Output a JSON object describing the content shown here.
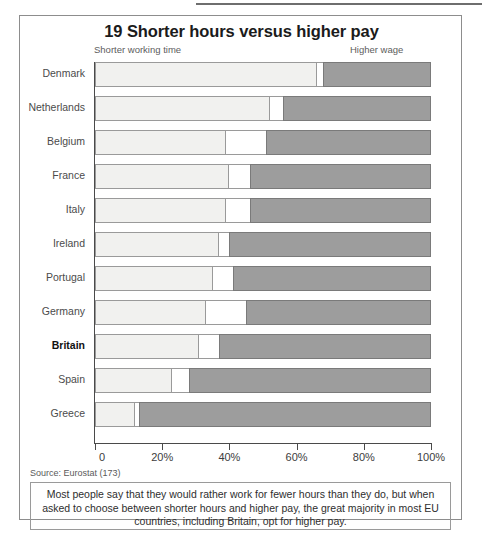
{
  "chart_data": {
    "type": "bar",
    "subtype": "stacked-horizontal-100",
    "title": "19 Shorter hours versus higher pay",
    "xlabel": "",
    "ylabel": "",
    "xlim": [
      0,
      100
    ],
    "grid": false,
    "legend_position": "above-axis-ends",
    "left_end_label": "Shorter working time",
    "right_end_label": "Higher wage",
    "categories": [
      "Denmark",
      "Netherlands",
      "Belgium",
      "France",
      "Italy",
      "Ireland",
      "Portugal",
      "Germany",
      "Britain",
      "Spain",
      "Greece"
    ],
    "highlight_category": "Britain",
    "series": [
      {
        "name": "Shorter working time",
        "values": [
          66,
          52,
          39,
          40,
          39,
          37,
          35,
          33,
          31,
          23,
          12
        ]
      },
      {
        "name": "Neither / undecided",
        "values": [
          2,
          4,
          12,
          6,
          7,
          3,
          6,
          12,
          6,
          5,
          1
        ]
      },
      {
        "name": "Higher wage",
        "values": [
          32,
          44,
          49,
          54,
          54,
          60,
          59,
          55,
          63,
          72,
          87
        ]
      }
    ],
    "xticks": [
      {
        "value": 0,
        "label": "0"
      },
      {
        "value": 20,
        "label": "20%"
      },
      {
        "value": 40,
        "label": "40%"
      },
      {
        "value": 60,
        "label": "60%"
      },
      {
        "value": 80,
        "label": "80%"
      },
      {
        "value": 100,
        "label": "100%"
      }
    ],
    "colors": {
      "shorter": "#f1f1ef",
      "middle": "#ffffff",
      "higher": "#9d9d9d",
      "outline": "#9a9a9a"
    }
  },
  "source": "Source: Eurostat (173)",
  "caption": "Most people say that they would rather work for fewer hours than they do, but when asked to choose between shorter hours and higher pay, the great majority in most EU countries, including Britain, opt for higher pay."
}
